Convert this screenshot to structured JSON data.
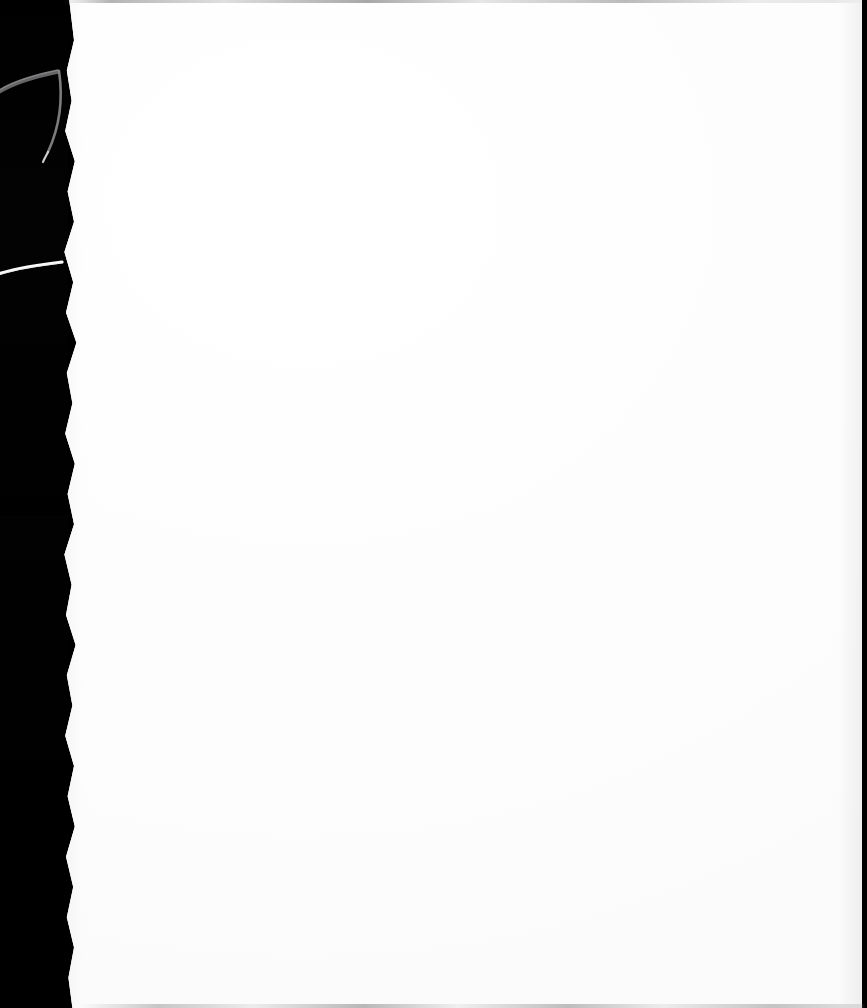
{
  "document": {
    "kind": "scanned-page",
    "title": "Scanned blank page",
    "page_content": "",
    "page_text": "",
    "orientation": "portrait",
    "background_color": "#ffffff",
    "frame_color": "#000000"
  },
  "canvas": {
    "width_px": 867,
    "height_px": 1008
  },
  "page": {
    "left_px": 62,
    "top_px": 0,
    "width_px": 800,
    "height_px": 1008,
    "paper_color": "#ffffff",
    "edge_style": "torn-ragged-left"
  },
  "scanner_bed": {
    "label": "",
    "color": "#000000",
    "band_width_px": 64,
    "position": "left"
  },
  "artifacts": [
    {
      "name": "page-curl-arc",
      "description": "",
      "color": "#8c8c8e",
      "x_px": -4,
      "y_px": 52,
      "width_px": 76,
      "height_px": 118
    },
    {
      "name": "torn-edge-highlight",
      "description": "",
      "color": "#ffffff",
      "x_px": -2,
      "y_px": 248,
      "width_px": 72,
      "height_px": 32
    },
    {
      "name": "scan-line-top",
      "description": "",
      "color": "#78787a",
      "x_px": 62,
      "y_px": 0,
      "width_px": 805,
      "height_px": 3
    },
    {
      "name": "scan-line-bottom",
      "description": "",
      "color": "#78787a",
      "x_px": 80,
      "y_px": 1004,
      "width_px": 787,
      "height_px": 4
    },
    {
      "name": "right-edge-strip",
      "description": "",
      "color": "#000000",
      "x_px": 862,
      "y_px": 0,
      "width_px": 5,
      "height_px": 1008
    }
  ],
  "ghost_marks": [
    {
      "name": "ghost-mark-upper-right",
      "text": ""
    },
    {
      "name": "ghost-mark-lower-right",
      "text": ""
    },
    {
      "name": "ghost-mark-top-center",
      "text": ""
    },
    {
      "name": "ghost-mark-mid-left",
      "text": ""
    },
    {
      "name": "ghost-mark-lower-left",
      "text": ""
    }
  ]
}
